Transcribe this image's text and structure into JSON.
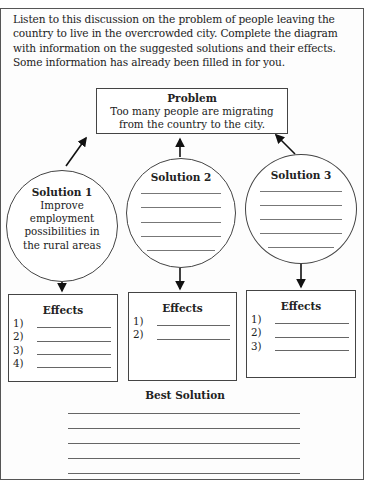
{
  "instructions": "Listen to this discussion on the problem of people leaving the country to live in the overcrowded city. Complete the diagram with information on the suggested solutions and their effects. Some information has already been filled in for you.",
  "problem": {
    "title": "Problem",
    "text": "Too many people are migrating from the country to the city."
  },
  "solutions": [
    {
      "title": "Solution 1",
      "text": "Improve employment possibilities in the rural areas",
      "blank_lines": 0
    },
    {
      "title": "Solution 2",
      "text": "",
      "blank_lines": 5
    },
    {
      "title": "Solution 3",
      "text": "",
      "blank_lines": 5
    }
  ],
  "effects": [
    {
      "title": "Effects",
      "items": [
        "1)",
        "2)",
        "3)",
        "4)"
      ]
    },
    {
      "title": "Effects",
      "items": [
        "1)",
        "2)"
      ]
    },
    {
      "title": "Effects",
      "items": [
        "1)",
        "2)",
        "3)"
      ]
    }
  ],
  "best_solution": {
    "title": "Best Solution",
    "blank_lines": 5
  }
}
